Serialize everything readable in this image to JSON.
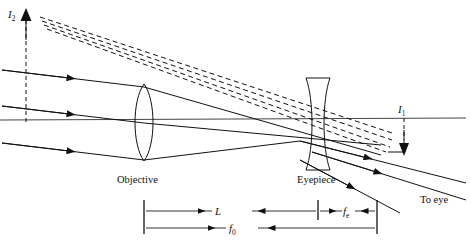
{
  "figure": {
    "title_hidden": "",
    "type": "optical ray diagram - astronomical telescope with diverging eyepiece"
  },
  "labels": {
    "image_two": "I",
    "image_two_sub": "2",
    "image_one": "I",
    "image_one_sub": "1",
    "objective": "Objective",
    "eyepiece": "Eyepiece",
    "to_eye": "To eye"
  },
  "dimensions": {
    "tube_length": "L",
    "focal_objective": "f",
    "focal_objective_sub": "0",
    "focal_eyepiece": "f",
    "focal_eyepiece_sub": "e"
  },
  "colors": {
    "ink": "#111111",
    "axis": "#444444",
    "background": "#ffffff"
  }
}
